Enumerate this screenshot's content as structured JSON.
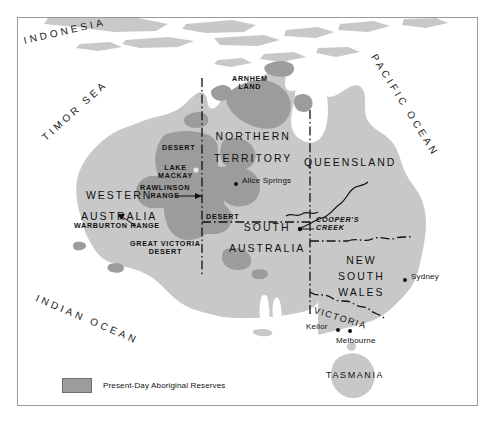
{
  "map": {
    "title": "Present-Day Aboriginal Reserves of Australia",
    "colors": {
      "land": "#c8c8c8",
      "reserve": "#9c9c9c",
      "water": "#ffffff",
      "ink": "#111111",
      "frame": "#9a9a9a"
    },
    "legend": {
      "label": "Present-Day Aboriginal Reserves",
      "swatch_color": "#9c9c9c"
    },
    "oceans": [
      {
        "name": "INDONESIA",
        "label": "INDONESIA"
      },
      {
        "name": "TIMOR SEA",
        "label": "TIMOR SEA"
      },
      {
        "name": "PACIFIC OCEAN",
        "label": "PACIFIC OCEAN"
      },
      {
        "name": "INDIAN OCEAN",
        "label": "INDIAN OCEAN"
      }
    ],
    "states": [
      {
        "name": "northern-territory",
        "line1": "NORTHERN",
        "line2": "TERRITORY"
      },
      {
        "name": "queensland",
        "label": "QUEENSLAND"
      },
      {
        "name": "western-australia",
        "line1": "WESTERN",
        "line2": "AUSTRALIA"
      },
      {
        "name": "south-australia",
        "line1": "SOUTH",
        "line2": "AUSTRALIA"
      },
      {
        "name": "new-south-wales",
        "line1": "NEW",
        "line2": "SOUTH",
        "line3": "WALES"
      },
      {
        "name": "victoria",
        "label": "VICTORIA"
      },
      {
        "name": "tasmania",
        "label": "TASMANIA"
      }
    ],
    "features": [
      {
        "name": "arnhem-land",
        "line1": "ARNHEM",
        "line2": "LAND"
      },
      {
        "name": "desert-north",
        "label": "DESERT"
      },
      {
        "name": "lake-mackay",
        "line1": "LAKE",
        "line2": "MACKAY"
      },
      {
        "name": "rawlinson-range",
        "line1": "RAWLINSON",
        "line2": "RANGE"
      },
      {
        "name": "warburton-range",
        "label": "WARBURTON RANGE"
      },
      {
        "name": "desert-central",
        "label": "DESERT"
      },
      {
        "name": "great-victoria-desert",
        "line1": "GREAT VICTORIA",
        "line2": "DESERT"
      },
      {
        "name": "coopers-creek",
        "line1": "COOPER'S",
        "line2": "CREEK"
      }
    ],
    "cities": [
      {
        "name": "alice-springs",
        "label": "Alice Springs"
      },
      {
        "name": "sydney",
        "label": "Sydney"
      },
      {
        "name": "keilor",
        "label": "Keilor"
      },
      {
        "name": "melbourne",
        "label": "Melbourne"
      }
    ]
  }
}
